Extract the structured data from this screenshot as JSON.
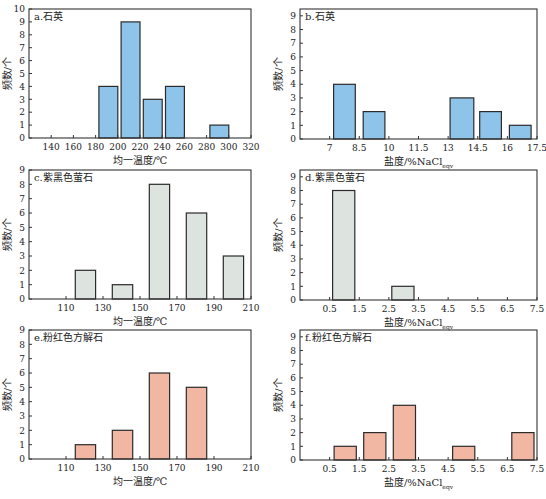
{
  "figure": {
    "layout": "3 rows x 2 columns of histograms",
    "ylabel": "频数/个"
  },
  "chart_data": [
    {
      "id": "a",
      "type": "bar",
      "title": "a.石英",
      "xlabel": "均一温度/℃",
      "ylabel": "频数/个",
      "xlim": [
        120,
        320
      ],
      "ylim": [
        0,
        10
      ],
      "xticks": [
        140,
        160,
        180,
        200,
        220,
        240,
        260,
        280,
        300,
        320
      ],
      "yticks": [
        0,
        1,
        2,
        3,
        4,
        5,
        6,
        7,
        8,
        9,
        10
      ],
      "bins": [
        [
          183,
          200
        ],
        [
          203,
          220
        ],
        [
          223,
          240
        ],
        [
          243,
          260
        ],
        [
          283,
          300
        ]
      ],
      "values": [
        4,
        9,
        3,
        4,
        1
      ],
      "bar_color": "#8ec3ea",
      "grid": false
    },
    {
      "id": "b",
      "type": "bar",
      "title": "b.石英",
      "xlabel": "盐度/%NaCl",
      "xlabel_sub": "eqv",
      "ylabel": "频数/个",
      "xlim": [
        5.5,
        17.5
      ],
      "ylim": [
        0,
        9.5
      ],
      "xticks": [
        7,
        8.5,
        10,
        11.5,
        13,
        14.5,
        16,
        17.5
      ],
      "yticks": [
        0,
        1,
        2,
        3,
        4,
        5,
        6,
        7,
        8,
        9
      ],
      "bins": [
        [
          7.2,
          8.3
        ],
        [
          8.7,
          9.8
        ],
        [
          13.1,
          14.3
        ],
        [
          14.6,
          15.7
        ],
        [
          16.1,
          17.2
        ]
      ],
      "values": [
        4,
        2,
        3,
        2,
        1
      ],
      "bar_color": "#8ec3ea",
      "grid": false
    },
    {
      "id": "c",
      "type": "bar",
      "title": "c.紫黑色萤石",
      "xlabel": "均一温度/℃",
      "ylabel": "频数/个",
      "xlim": [
        90,
        210
      ],
      "ylim": [
        0,
        9
      ],
      "xticks": [
        110,
        130,
        150,
        170,
        190,
        210
      ],
      "yticks": [
        0,
        1,
        2,
        3,
        4,
        5,
        6,
        7,
        8,
        9
      ],
      "bins": [
        [
          115,
          126
        ],
        [
          135,
          146
        ],
        [
          155,
          166
        ],
        [
          175,
          186
        ],
        [
          195,
          206
        ]
      ],
      "values": [
        2,
        1,
        8,
        6,
        3
      ],
      "bar_color": "#dde3df",
      "grid": false
    },
    {
      "id": "d",
      "type": "bar",
      "title": "d.紫黑色萤石",
      "xlabel": "盐度/%NaCl",
      "xlabel_sub": "eqv",
      "ylabel": "频数/个",
      "xlim": [
        -0.5,
        7.5
      ],
      "ylim": [
        0,
        9.5
      ],
      "xticks": [
        0.5,
        1.5,
        2.5,
        3.5,
        4.5,
        5.5,
        6.5,
        7.5
      ],
      "yticks": [
        0,
        1,
        2,
        3,
        4,
        5,
        6,
        7,
        8,
        9
      ],
      "bins": [
        [
          0.6,
          1.35
        ],
        [
          2.6,
          3.35
        ]
      ],
      "values": [
        8,
        1
      ],
      "bar_color": "#dde3df",
      "grid": false
    },
    {
      "id": "e",
      "type": "bar",
      "title": "e.粉红色方解石",
      "xlabel": "均一温度/℃",
      "ylabel": "频数/个",
      "xlim": [
        90,
        210
      ],
      "ylim": [
        0,
        9
      ],
      "xticks": [
        110,
        130,
        150,
        170,
        190,
        210
      ],
      "yticks": [
        0,
        1,
        2,
        3,
        4,
        5,
        6,
        7,
        8,
        9
      ],
      "bins": [
        [
          115,
          126
        ],
        [
          135,
          146
        ],
        [
          155,
          166
        ],
        [
          175,
          186
        ]
      ],
      "values": [
        1,
        2,
        6,
        5
      ],
      "bar_color": "#f2b7a3",
      "grid": false
    },
    {
      "id": "f",
      "type": "bar",
      "title": "f.粉红色方解石",
      "xlabel": "盐度/%NaCl",
      "xlabel_sub": "eqv",
      "ylabel": "频数/个",
      "xlim": [
        -0.5,
        7.5
      ],
      "ylim": [
        0,
        9.5
      ],
      "xticks": [
        0.5,
        1.5,
        2.5,
        3.5,
        4.5,
        5.5,
        6.5,
        7.5
      ],
      "yticks": [
        0,
        1,
        2,
        3,
        4,
        5,
        6,
        7,
        8,
        9
      ],
      "bins": [
        [
          0.65,
          1.4
        ],
        [
          1.65,
          2.4
        ],
        [
          2.65,
          3.4
        ],
        [
          4.65,
          5.4
        ],
        [
          6.65,
          7.4
        ]
      ],
      "values": [
        1,
        2,
        4,
        1,
        2
      ],
      "bar_color": "#f2b7a3",
      "grid": false
    }
  ],
  "panel_frames": [
    {
      "x": 29,
      "y": 9,
      "w": 222,
      "h": 129
    },
    {
      "x": 300,
      "y": 9,
      "w": 237,
      "h": 130
    },
    {
      "x": 29,
      "y": 170,
      "w": 222,
      "h": 129
    },
    {
      "x": 300,
      "y": 170,
      "w": 237,
      "h": 130
    },
    {
      "x": 29,
      "y": 330,
      "w": 222,
      "h": 129
    },
    {
      "x": 300,
      "y": 330,
      "w": 237,
      "h": 130
    }
  ]
}
